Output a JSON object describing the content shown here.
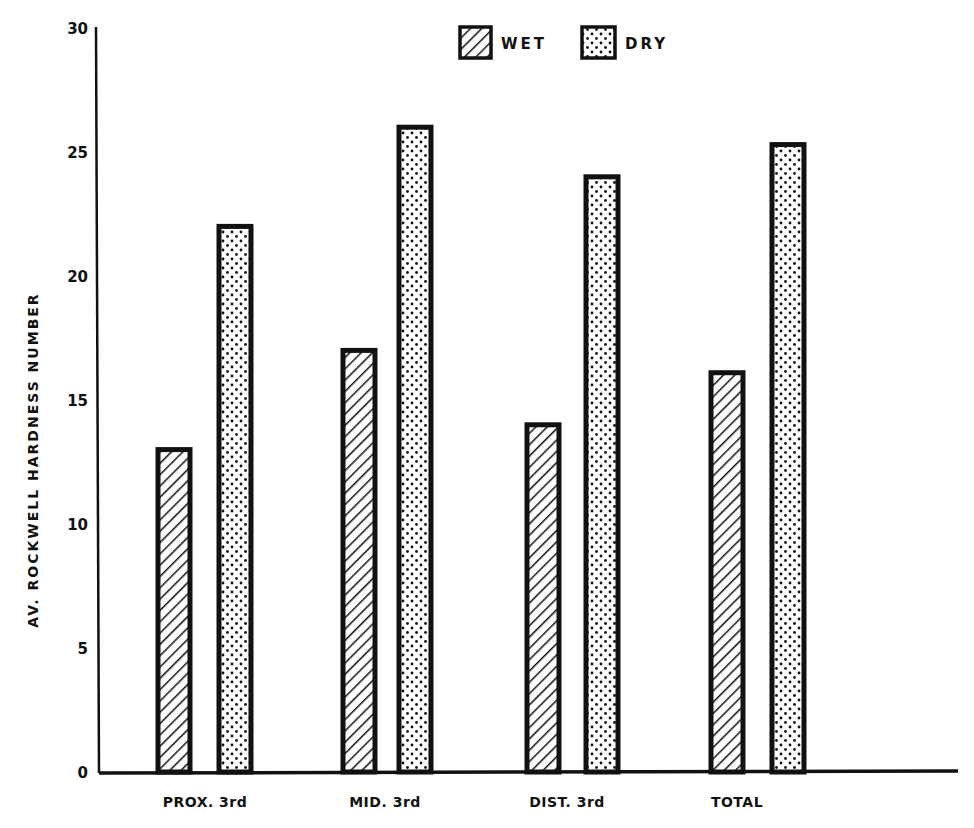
{
  "chart_data": {
    "type": "bar",
    "title": "",
    "xlabel": "",
    "ylabel": "AV. ROCKWELL HARDNESS NUMBER",
    "ylim": [
      0,
      30
    ],
    "yticks": [
      0,
      5,
      10,
      15,
      20,
      25,
      30
    ],
    "grid": false,
    "legend_position": "top-center",
    "categories": [
      "PROX. 3rd",
      "MID. 3rd",
      "DIST. 3rd",
      "TOTAL"
    ],
    "series": [
      {
        "name": "WET",
        "pattern": "diagonal-hatch",
        "values": [
          13,
          17,
          14,
          16.1
        ]
      },
      {
        "name": "DRY",
        "pattern": "dots",
        "values": [
          22,
          26,
          24,
          25.3
        ]
      }
    ]
  },
  "colors": {
    "ink": "#111111",
    "background": "#ffffff"
  }
}
